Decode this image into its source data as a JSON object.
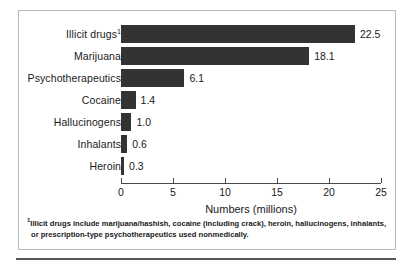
{
  "chart_data": {
    "type": "bar",
    "orientation": "horizontal",
    "title": "",
    "xlabel": "Numbers (millions)",
    "ylabel": "",
    "xlim": [
      0,
      25
    ],
    "xticks": [
      0,
      5,
      10,
      15,
      20,
      25
    ],
    "grid": false,
    "legend": null,
    "bar_color": "#333333",
    "categories": [
      "Illicit drugs",
      "Marijuana",
      "Psychotherapeutics",
      "Cocaine",
      "Hallucinogens",
      "Inhalants",
      "Heroin"
    ],
    "values": [
      22.5,
      18.1,
      6.1,
      1.4,
      1.0,
      0.6,
      0.3
    ],
    "bars": [
      {
        "label": "Illicit drugs",
        "superscript": "1",
        "value": 22.5,
        "value_label": "22.5"
      },
      {
        "label": "Marijuana",
        "superscript": "",
        "value": 18.1,
        "value_label": "18.1"
      },
      {
        "label": "Psychotherapeutics",
        "superscript": "",
        "value": 6.1,
        "value_label": "6.1"
      },
      {
        "label": "Cocaine",
        "superscript": "",
        "value": 1.4,
        "value_label": "1.4"
      },
      {
        "label": "Hallucinogens",
        "superscript": "",
        "value": 1.0,
        "value_label": "1.0"
      },
      {
        "label": "Inhalants",
        "superscript": "",
        "value": 0.6,
        "value_label": "0.6"
      },
      {
        "label": "Heroin",
        "superscript": "",
        "value": 0.3,
        "value_label": "0.3"
      }
    ],
    "annotations": [
      "1Illicit drugs include marijuana/hashish, cocaine (including crack), heroin, hallucinogens, inhalants, or prescription-type psychotherapeutics used nonmedically."
    ]
  },
  "footnote": {
    "marker": "1",
    "line1": "Illicit drugs include marijuana/hashish, cocaine (including crack), heroin, hallucinogens, inhalants,",
    "line2": "or prescription-type psychotherapeutics used nonmedically."
  }
}
